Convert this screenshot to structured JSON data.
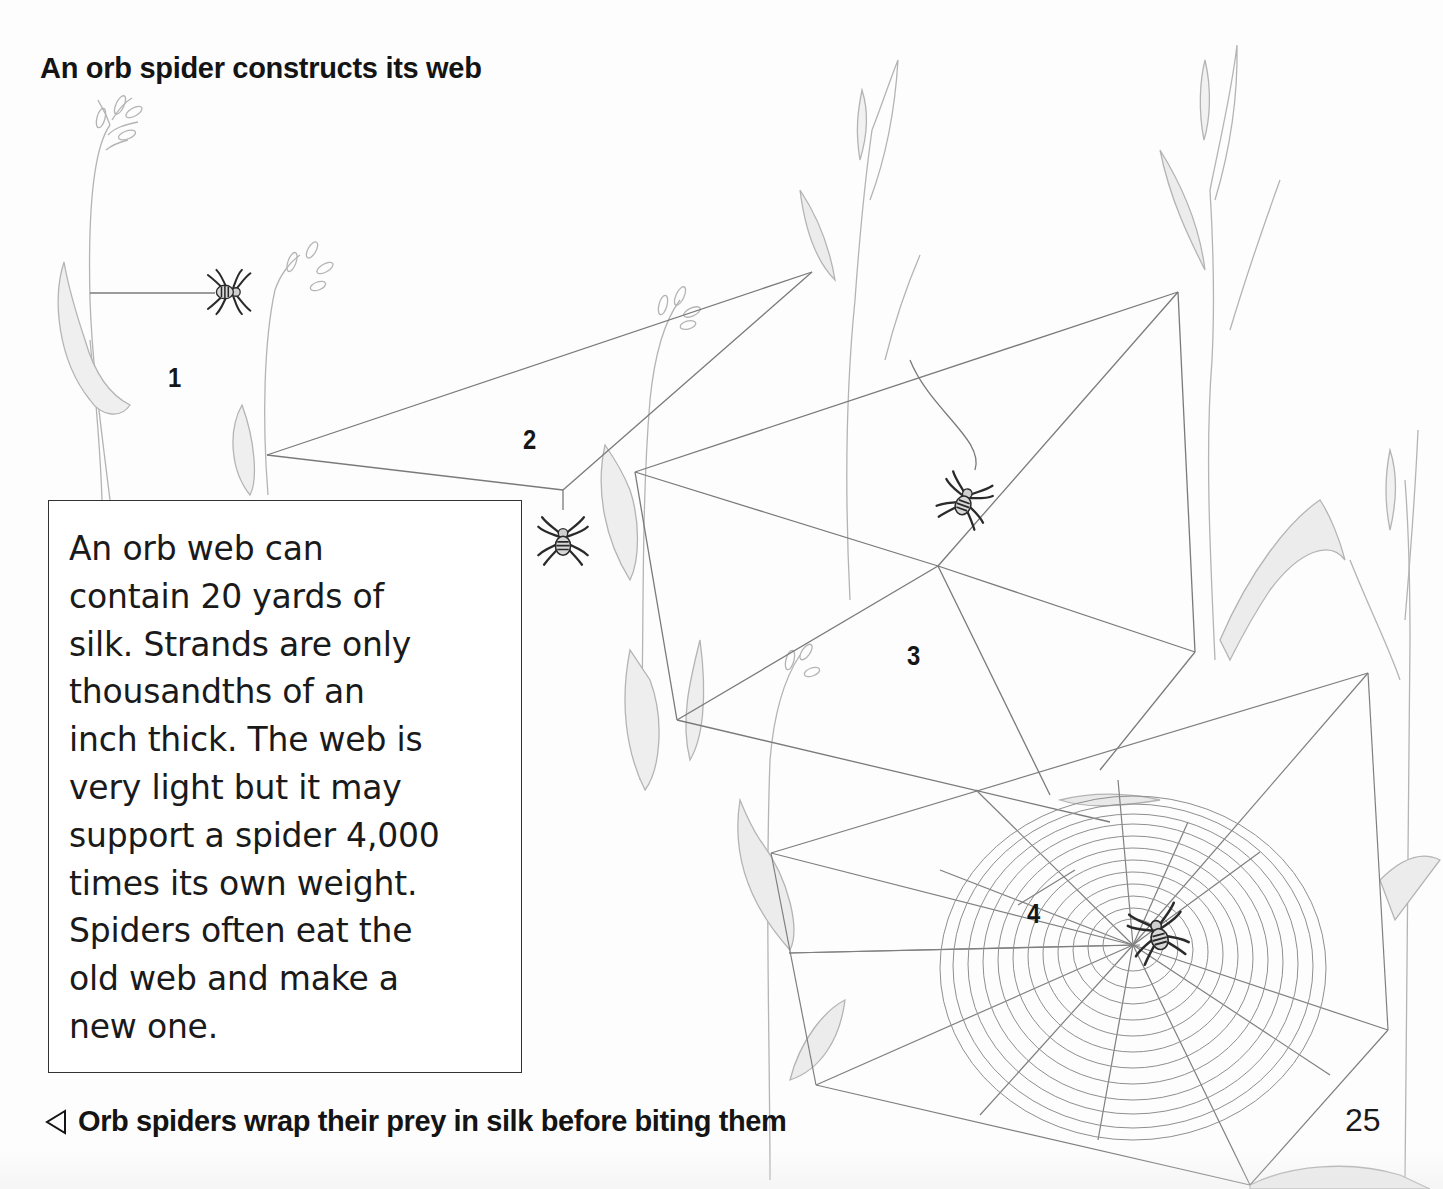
{
  "page": {
    "title": "An orb spider constructs its web",
    "page_number": "25"
  },
  "stages": [
    {
      "label": "1",
      "description": "spider attaches first bridge thread between stems"
    },
    {
      "label": "2",
      "description": "spider drops from Y-shaped frame thread"
    },
    {
      "label": "3",
      "description": "spider lays radial and frame threads"
    },
    {
      "label": "4",
      "description": "completed orb web with spiral, spider at hub"
    }
  ],
  "info_box": {
    "lines": [
      "An orb web can",
      "contain 20 yards of",
      "silk. Strands are only",
      "thousandths of an",
      "inch thick. The web is",
      "very light but it may",
      "support a spider 4,000",
      "times its own weight.",
      "Spiders often eat the",
      "old web and make a",
      "new one."
    ]
  },
  "caption": {
    "arrow_icon": "left-pointing-triangle",
    "text": "Orb spiders wrap their prey in silk before biting them"
  },
  "colors": {
    "text": "#141414",
    "pencil_line": "#8a8a8a",
    "silk_line": "#7a7a7a",
    "spider": "#2a2a2a",
    "box_border": "#333333",
    "paper": "#fdfdfd"
  }
}
